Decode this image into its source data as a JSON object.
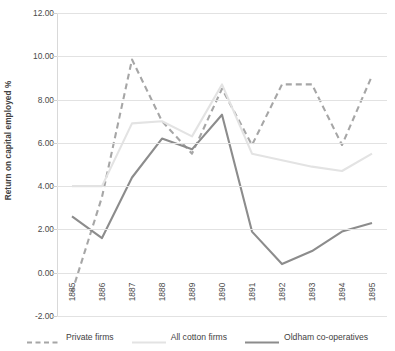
{
  "chart_data": {
    "type": "line",
    "title": "",
    "xlabel": "",
    "ylabel": "Return on capital employed %",
    "categories": [
      "1885",
      "1886",
      "1887",
      "1888",
      "1889",
      "1890",
      "1891",
      "1892",
      "1893",
      "1894",
      "1895"
    ],
    "ylim": [
      -2.0,
      12.0
    ],
    "ytick_labels": [
      "12.00",
      "10.00",
      "8.00",
      "6.00",
      "4.00",
      "2.00",
      "0.00",
      "-2.00"
    ],
    "ytick_values": [
      12.0,
      10.0,
      8.0,
      6.0,
      4.0,
      2.0,
      0.0,
      -2.0
    ],
    "grid": true,
    "legend_position": "bottom",
    "series": [
      {
        "name": "Private firms",
        "style": "dashed",
        "color": "#a6a6a6",
        "values": [
          -0.9,
          3.5,
          9.85,
          7.0,
          5.5,
          8.5,
          5.9,
          8.7,
          8.7,
          5.9,
          9.1
        ]
      },
      {
        "name": "All cotton firms",
        "style": "solid",
        "color": "#e3e3e3",
        "values": [
          4.0,
          4.0,
          6.9,
          7.0,
          6.3,
          8.7,
          5.5,
          5.2,
          4.9,
          4.7,
          5.5
        ]
      },
      {
        "name": "Oldham co-operatives",
        "style": "solid",
        "color": "#8c8c8c",
        "values": [
          2.6,
          1.6,
          4.4,
          6.2,
          5.7,
          7.3,
          1.9,
          0.4,
          1.0,
          1.9,
          2.3
        ]
      }
    ]
  },
  "legend": {
    "items": [
      {
        "label": "Private firms"
      },
      {
        "label": "All cotton firms"
      },
      {
        "label": "Oldham co-operatives"
      }
    ]
  }
}
